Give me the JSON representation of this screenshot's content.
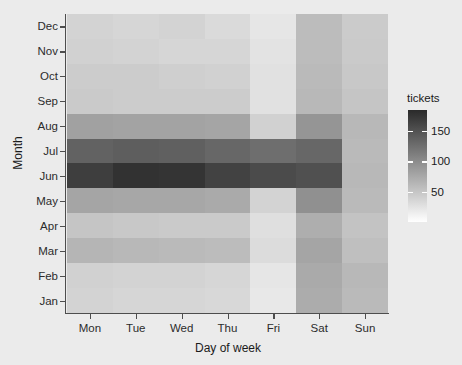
{
  "chart_data": {
    "type": "heatmap",
    "title": "",
    "xlabel": "Day of week",
    "ylabel": "Month",
    "x_categories": [
      "Mon",
      "Tue",
      "Wed",
      "Thu",
      "Fri",
      "Sat",
      "Sun"
    ],
    "y_categories": [
      "Dec",
      "Nov",
      "Oct",
      "Sep",
      "Aug",
      "Jul",
      "Jun",
      "May",
      "Apr",
      "Mar",
      "Feb",
      "Jan"
    ],
    "legend": {
      "title": "tickets",
      "ticks": [
        150,
        100,
        50
      ],
      "tick_labels": [
        "150",
        "100",
        "50"
      ],
      "range": [
        0,
        185
      ],
      "position": "right",
      "gradient_low": "#ffffff",
      "gradient_high": "#3d3d3d"
    },
    "grid": true,
    "rows": [
      {
        "month": "Dec",
        "values": [
          38,
          36,
          38,
          32,
          22,
          58,
          45
        ]
      },
      {
        "month": "Nov",
        "values": [
          40,
          38,
          36,
          36,
          24,
          58,
          46
        ]
      },
      {
        "month": "Oct",
        "values": [
          44,
          44,
          42,
          40,
          26,
          60,
          48
        ]
      },
      {
        "month": "Sep",
        "values": [
          46,
          44,
          44,
          44,
          26,
          62,
          50
        ]
      },
      {
        "month": "Aug",
        "values": [
          82,
          80,
          80,
          78,
          40,
          92,
          62
        ]
      },
      {
        "month": "Jul",
        "values": [
          136,
          140,
          138,
          132,
          126,
          132,
          60
        ]
      },
      {
        "month": "Jun",
        "values": [
          168,
          178,
          176,
          164,
          156,
          152,
          62
        ]
      },
      {
        "month": "May",
        "values": [
          78,
          76,
          76,
          74,
          38,
          96,
          60
        ]
      },
      {
        "month": "Apr",
        "values": [
          50,
          48,
          46,
          46,
          28,
          70,
          52
        ]
      },
      {
        "month": "Mar",
        "values": [
          64,
          62,
          60,
          58,
          30,
          78,
          56
        ]
      },
      {
        "month": "Feb",
        "values": [
          40,
          38,
          38,
          36,
          22,
          74,
          62
        ]
      },
      {
        "month": "Jan",
        "values": [
          38,
          36,
          36,
          34,
          20,
          72,
          60
        ]
      }
    ]
  },
  "axes": {
    "x_title": "Day of week",
    "y_title": "Month"
  }
}
